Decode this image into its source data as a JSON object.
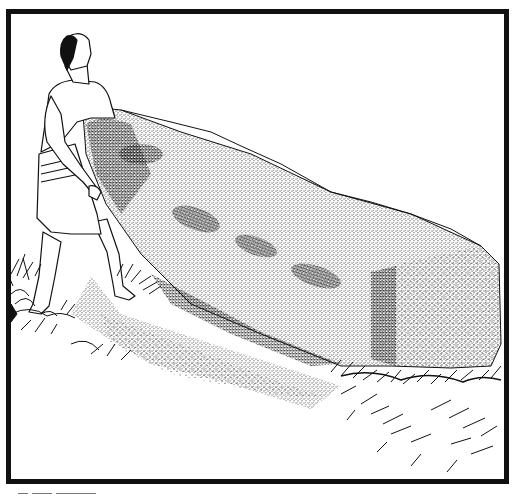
{
  "illustration": {
    "subject": "man lifting standing stone",
    "style": "black ink stipple drawing",
    "colors": {
      "ink": "#111111",
      "paper": "#ffffff"
    },
    "elements": [
      "frame-border",
      "man-figure",
      "standing-stone",
      "grass-tufts",
      "ground-shadow"
    ]
  },
  "signature": {
    "visible": true,
    "legible": false
  }
}
